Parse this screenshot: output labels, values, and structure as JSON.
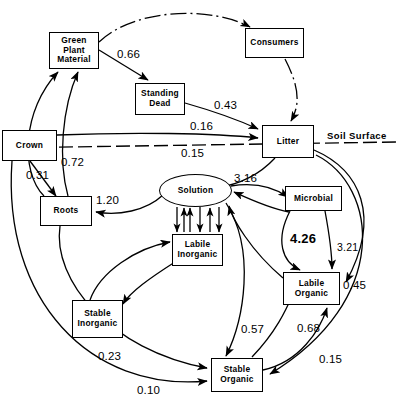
{
  "diagram": {
    "soil_surface_label": "Soil Surface",
    "nodes": [
      {
        "id": "green_plant_material",
        "label": "Green\nPlant\nMaterial",
        "shape": "box",
        "x": 49,
        "y": 32,
        "w": 50,
        "h": 37
      },
      {
        "id": "consumers",
        "label": "Consumers",
        "shape": "box",
        "x": 245,
        "y": 28,
        "w": 59,
        "h": 30
      },
      {
        "id": "standing_dead",
        "label": "Standing\nDead",
        "shape": "box",
        "x": 135,
        "y": 83,
        "w": 50,
        "h": 32
      },
      {
        "id": "litter",
        "label": "Litter",
        "shape": "box",
        "x": 262,
        "y": 125,
        "w": 52,
        "h": 33
      },
      {
        "id": "crown",
        "label": "Crown",
        "shape": "box",
        "x": 2,
        "y": 130,
        "w": 55,
        "h": 31
      },
      {
        "id": "roots",
        "label": "Roots",
        "shape": "box",
        "x": 40,
        "y": 196,
        "w": 52,
        "h": 30
      },
      {
        "id": "solution",
        "label": "Solution",
        "shape": "ellipse",
        "x": 159,
        "y": 174,
        "w": 73,
        "h": 33
      },
      {
        "id": "microbial",
        "label": "Microbial",
        "shape": "box",
        "x": 285,
        "y": 186,
        "w": 57,
        "h": 25
      },
      {
        "id": "labile_inorganic",
        "label": "Labile\nInorganic",
        "shape": "box",
        "x": 172,
        "y": 234,
        "w": 51,
        "h": 32
      },
      {
        "id": "labile_organic",
        "label": "Labile\nOrganic",
        "shape": "box",
        "x": 283,
        "y": 272,
        "w": 57,
        "h": 33
      },
      {
        "id": "stable_inorganic",
        "label": "Stable\nInorganic",
        "shape": "box",
        "x": 72,
        "y": 300,
        "w": 51,
        "h": 38
      },
      {
        "id": "stable_organic",
        "label": "Stable\nOrganic",
        "shape": "box",
        "x": 211,
        "y": 358,
        "w": 52,
        "h": 34
      }
    ],
    "flow_labels": [
      {
        "id": "f066",
        "value": "0.66",
        "x": 117,
        "y": 48,
        "from": "green_plant_material",
        "to": "standing_dead"
      },
      {
        "id": "f043",
        "value": "0.43",
        "x": 214,
        "y": 99,
        "from": "standing_dead",
        "to": "litter"
      },
      {
        "id": "f016",
        "value": "0.16",
        "x": 190,
        "y": 120,
        "from": "crown",
        "to": "litter"
      },
      {
        "id": "f015_litter_solution",
        "value": "0.15",
        "x": 181,
        "y": 147,
        "from": "litter",
        "to": "solution"
      },
      {
        "id": "f072",
        "value": "0.72",
        "x": 61,
        "y": 156,
        "from": "roots",
        "to": "crown"
      },
      {
        "id": "f031",
        "value": "0.31",
        "x": 26,
        "y": 169,
        "from": "crown",
        "to": "roots"
      },
      {
        "id": "f316",
        "value": "3.16",
        "x": 234,
        "y": 172,
        "from": "solution",
        "to": "microbial"
      },
      {
        "id": "f120",
        "value": "1.20",
        "x": 96,
        "y": 194,
        "from": "solution",
        "to": "roots"
      },
      {
        "id": "f426",
        "value": "4.26",
        "x": 290,
        "y": 231,
        "from": "microbial",
        "to": "labile_organic"
      },
      {
        "id": "f321",
        "value": "3.21",
        "x": 337,
        "y": 241,
        "from": "microbial",
        "to": "labile_organic"
      },
      {
        "id": "f045",
        "value": "0.45",
        "x": 343,
        "y": 279,
        "from": "litter",
        "to": "labile_organic"
      },
      {
        "id": "f057",
        "value": "0.57",
        "x": 241,
        "y": 323,
        "from": "solution",
        "to": "stable_organic"
      },
      {
        "id": "f068",
        "value": "0.68",
        "x": 297,
        "y": 322,
        "from": "stable_organic",
        "to": "labile_organic"
      },
      {
        "id": "f023",
        "value": "0.23",
        "x": 98,
        "y": 350,
        "from": "roots",
        "to": "stable_organic"
      },
      {
        "id": "f015_bottom",
        "value": "0.15",
        "x": 319,
        "y": 353,
        "from": "litter",
        "to": "stable_organic"
      },
      {
        "id": "f010",
        "value": "0.10",
        "x": 137,
        "y": 384,
        "from": "crown",
        "to": "stable_organic"
      }
    ]
  }
}
